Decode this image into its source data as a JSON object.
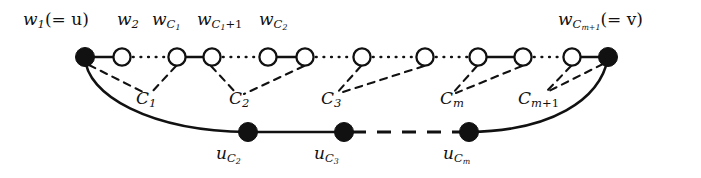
{
  "figure": {
    "type": "graph-diagram",
    "width": 701,
    "height": 178,
    "background": "#ffffff",
    "ink_color": "#111111"
  },
  "top_labels": [
    {
      "id": "w1",
      "text": "w",
      "sub": "1",
      "suffix": "(= u)",
      "x": 23,
      "y": 11
    },
    {
      "id": "w2",
      "text": "w",
      "sub": "2",
      "suffix": "",
      "x": 117,
      "y": 11
    },
    {
      "id": "wC1",
      "text": "w",
      "sub": "C1",
      "suffix": "",
      "x": 152,
      "y": 11
    },
    {
      "id": "wC1plus1",
      "text": "w",
      "sub": "C1+1",
      "suffix": "",
      "x": 197,
      "y": 11
    },
    {
      "id": "wC2",
      "text": "w",
      "sub": "C2",
      "suffix": "",
      "x": 259,
      "y": 11
    },
    {
      "id": "wCmplus1",
      "text": "w",
      "sub": "Cm+1",
      "suffix": "(= v)",
      "x": 558,
      "y": 11
    }
  ],
  "cluster_labels": [
    {
      "id": "C1",
      "text": "C",
      "sub": "1",
      "x": 136,
      "y": 90
    },
    {
      "id": "C2",
      "text": "C",
      "sub": "2",
      "x": 229,
      "y": 90
    },
    {
      "id": "C3",
      "text": "C",
      "sub": "3",
      "x": 321,
      "y": 90
    },
    {
      "id": "Cm",
      "text": "C",
      "sub": "m",
      "x": 440,
      "y": 90
    },
    {
      "id": "Cmplus1",
      "text": "C",
      "sub": "m+1",
      "x": 518,
      "y": 90
    }
  ],
  "bottom_labels": [
    {
      "id": "uC2",
      "text": "u",
      "sub": "C2",
      "x": 216,
      "y": 145
    },
    {
      "id": "uC3",
      "text": "u",
      "sub": "C3",
      "x": 314,
      "y": 145
    },
    {
      "id": "uCm",
      "text": "u",
      "sub": "Cm",
      "x": 443,
      "y": 145
    }
  ],
  "top_nodes": [
    {
      "id": "n1",
      "cx": 85,
      "cy": 57,
      "r": 9,
      "fill": "solid"
    },
    {
      "id": "n2",
      "cx": 122,
      "cy": 57,
      "r": 9,
      "fill": "open"
    },
    {
      "id": "n3",
      "cx": 177,
      "cy": 57,
      "r": 9,
      "fill": "open"
    },
    {
      "id": "n4",
      "cx": 212,
      "cy": 57,
      "r": 9,
      "fill": "open"
    },
    {
      "id": "n5",
      "cx": 268,
      "cy": 57,
      "r": 9,
      "fill": "open"
    },
    {
      "id": "n6",
      "cx": 305,
      "cy": 57,
      "r": 9,
      "fill": "open"
    },
    {
      "id": "n7",
      "cx": 362,
      "cy": 57,
      "r": 9,
      "fill": "open"
    },
    {
      "id": "n8",
      "cx": 425,
      "cy": 57,
      "r": 9,
      "fill": "open"
    },
    {
      "id": "n9",
      "cx": 478,
      "cy": 57,
      "r": 9,
      "fill": "open"
    },
    {
      "id": "n10",
      "cx": 523,
      "cy": 57,
      "r": 9,
      "fill": "open"
    },
    {
      "id": "n11",
      "cx": 572,
      "cy": 57,
      "r": 9,
      "fill": "open"
    },
    {
      "id": "n12",
      "cx": 608,
      "cy": 57,
      "r": 9,
      "fill": "solid"
    }
  ],
  "bottom_nodes": [
    {
      "id": "b1",
      "cx": 248,
      "cy": 132,
      "r": 9,
      "fill": "solid"
    },
    {
      "id": "b2",
      "cx": 344,
      "cy": 132,
      "r": 9,
      "fill": "solid"
    },
    {
      "id": "b3",
      "cx": 469,
      "cy": 132,
      "r": 9,
      "fill": "solid"
    }
  ],
  "top_edges": [
    {
      "from": "n1",
      "to": "n2",
      "style": "solid"
    },
    {
      "from": "n2",
      "to": "n3",
      "style": "dotted"
    },
    {
      "from": "n3",
      "to": "n4",
      "style": "solid"
    },
    {
      "from": "n4",
      "to": "n5",
      "style": "dotted"
    },
    {
      "from": "n5",
      "to": "n6",
      "style": "solid"
    },
    {
      "from": "n6",
      "to": "n7",
      "style": "dotted"
    },
    {
      "from": "n7",
      "to": "n8",
      "style": "dotted"
    },
    {
      "from": "n8",
      "to": "n9",
      "style": "dotted"
    },
    {
      "from": "n9",
      "to": "n10",
      "style": "solid"
    },
    {
      "from": "n10",
      "to": "n11",
      "style": "dotted"
    },
    {
      "from": "n11",
      "to": "n12",
      "style": "solid"
    }
  ],
  "bottom_edges": [
    {
      "from": "b1",
      "to": "b2",
      "style": "solid"
    },
    {
      "from": "b2",
      "to": "b3",
      "style": "dashed"
    }
  ],
  "arcs": [
    {
      "id": "left-arc",
      "from": "n1",
      "to": "b1",
      "style": "solid"
    },
    {
      "id": "right-arc",
      "from": "b3",
      "to": "n12",
      "style": "solid"
    }
  ],
  "dashed_connectors": [
    {
      "id": "C1-left",
      "from": "n1",
      "to_cluster": "C1",
      "style": "dashed"
    },
    {
      "id": "C1-right",
      "from": "n3",
      "to_cluster": "C1",
      "style": "dashed"
    },
    {
      "id": "C2-left",
      "from": "n4",
      "to_cluster": "C2",
      "style": "dashed"
    },
    {
      "id": "C2-right",
      "from": "n6",
      "to_cluster": "C2",
      "style": "dashed"
    },
    {
      "id": "C3-left",
      "from": "n7",
      "to_cluster": "C3",
      "style": "dashed"
    },
    {
      "id": "C3-right",
      "from": "n8",
      "to_cluster": "C3",
      "style": "dashed"
    },
    {
      "id": "Cm-left",
      "from": "n9",
      "to_cluster": "Cm",
      "style": "dashed"
    },
    {
      "id": "Cm-right",
      "from": "n10",
      "to_cluster": "Cm",
      "style": "dashed"
    },
    {
      "id": "Cmplus1-left",
      "from": "n11",
      "to_cluster": "Cmplus1",
      "style": "dashed"
    },
    {
      "id": "Cmplus1-right",
      "from": "n12",
      "to_cluster": "Cmplus1",
      "style": "dashed"
    }
  ]
}
